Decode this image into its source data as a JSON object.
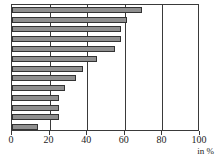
{
  "chart_data": {
    "type": "bar",
    "orientation": "horizontal",
    "title": "",
    "subtitle": "",
    "xlabel": "in %",
    "ylabel": "",
    "xlim": [
      0,
      100
    ],
    "ylim": null,
    "grid": true,
    "gridlines_axis": "x",
    "legend": null,
    "legend_position": "none",
    "annotations": [],
    "xticks": [
      0,
      20,
      40,
      60,
      80,
      100
    ],
    "xtick_labels": [
      "0",
      "20",
      "40",
      "60",
      "80",
      "100"
    ],
    "categories": [
      "",
      "",
      "",
      "",
      "",
      "",
      "",
      "",
      "",
      "",
      "",
      "",
      ""
    ],
    "values": [
      69,
      61,
      58,
      58,
      55,
      45,
      38,
      34,
      28,
      25,
      25,
      25,
      14
    ],
    "series": [
      {
        "name": "",
        "values": [
          69,
          61,
          58,
          58,
          55,
          45,
          38,
          34,
          28,
          25,
          25,
          25,
          14
        ]
      }
    ],
    "bar_count": 13,
    "bar_fill_color": "#8f8f8f",
    "bar_edge_color": "#333333",
    "frame_color": "#3a3a3a",
    "background_color": "#ffffff"
  },
  "axis": {
    "unit_caption": "in %"
  }
}
